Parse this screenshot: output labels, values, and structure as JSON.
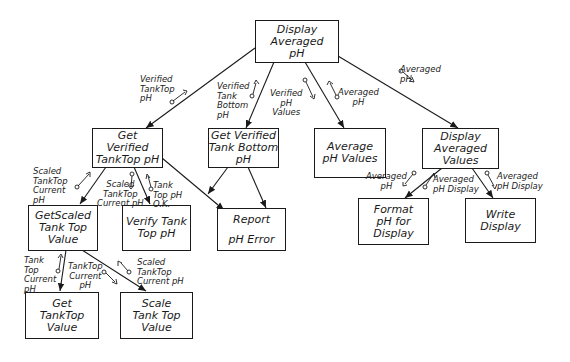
{
  "diagram": {
    "type": "structure chart",
    "modules": {
      "root": "Display\nAveraged\npH",
      "get_verified_top": "Get\nVerified\nTankTop pH",
      "get_verified_bottom": "Get Verified\nTank Bottom\npH",
      "average_values": "Average\npH Values",
      "display_values": "Display\nAveraged\nValues",
      "get_scaled_top": "GetScaled\nTank Top\nValue",
      "verify_top": "Verify Tank\nTop pH",
      "report_error": "Report\n\npH Error",
      "format_display": "Format\npH for\nDisplay",
      "write_display": "Write\nDisplay",
      "get_top_value": "Get\nTankTop\nValue",
      "scale_top_value": "Scale\nTank Top\nValue"
    },
    "couples": {
      "verified_tanktop_ph": "Verified\nTankTop\npH",
      "verified_tank_bottom_ph": "Verified\nTank\nBottom\npH",
      "verified_ph_values": "Verified\npH\nValues",
      "averaged_ph_1": "Averaged\npH",
      "averaged_ph_2": "Averaged\npH",
      "scaled_tanktop_current_ph_1": "Scaled\nTankTop\nCurrent\npH",
      "scaled_tanktop_current_ph_2": "Scaled\nTankTop\nCurrent pH",
      "tank_top_ph_ok": "Tank\nTop pH\nO.K.",
      "tank_top_current_ph": "Tank\nTop\nCurrent\npH",
      "tanktop_current_ph": "TankTop\nCurrent\npH",
      "scaled_tanktop_current_ph_3": "Scaled\nTankTop\nCurrent pH",
      "averaged_ph_3": "Averaged\npH",
      "averaged_ph_display_1": "Averaged\npH Display",
      "averaged_ph_display_2": "Averaged\npH Display"
    }
  }
}
